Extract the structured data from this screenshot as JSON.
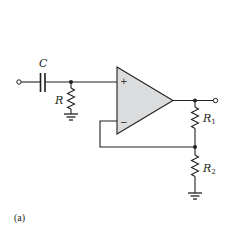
{
  "figure": {
    "caption": "(a)"
  },
  "components": {
    "capacitor": {
      "label": "C"
    },
    "input_resistor": {
      "label": "R"
    },
    "feedback_r1": {
      "label": "R",
      "subscript": "1"
    },
    "feedback_r2": {
      "label": "R",
      "subscript": "2"
    },
    "opamp": {
      "plus_sign": "+",
      "minus_sign": "−",
      "fill_color": "#dbdcdd"
    }
  },
  "colors": {
    "wire": "#231f20",
    "background": "#ffffff",
    "opamp_fill": "#dbdcdd"
  }
}
